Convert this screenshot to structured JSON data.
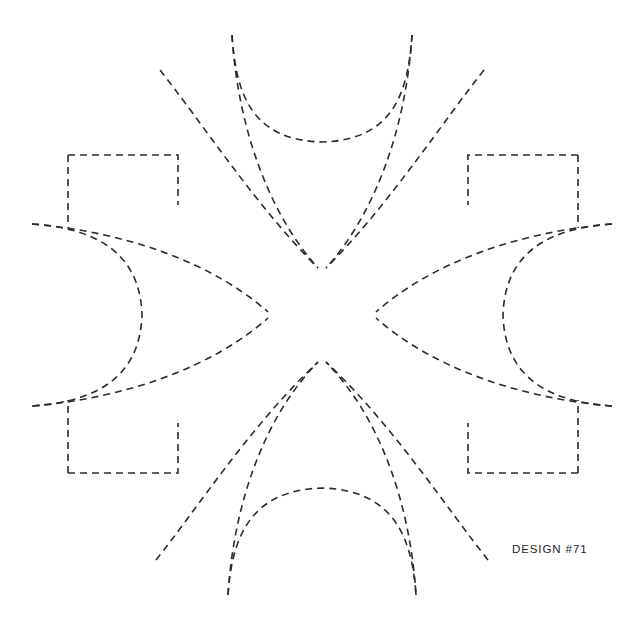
{
  "page": {
    "background_color": "#ffffff",
    "width": 635,
    "height": 629
  },
  "design": {
    "label": "DESIGN #71",
    "title": "DESIGN #71",
    "stroke_color": "#2b2b2b",
    "stroke_width": 1.6,
    "dash_pattern": "7 5",
    "center_x": 322,
    "center_y": 315,
    "symmetry": "8-fold radial (4 axial arms + 4 diagonal arms)",
    "motif": "dashed-outline eight-pointed floral star with corner bracket notches",
    "axial_tips": [
      {
        "name": "top-left-axial-tip",
        "x": 232,
        "y": 35
      },
      {
        "name": "top-right-axial-tip",
        "x": 412,
        "y": 35
      },
      {
        "name": "left-upper-axial-tip",
        "x": 32,
        "y": 224
      },
      {
        "name": "left-lower-axial-tip",
        "x": 32,
        "y": 406
      },
      {
        "name": "right-upper-axial-tip",
        "x": 612,
        "y": 224
      },
      {
        "name": "right-lower-axial-tip",
        "x": 612,
        "y": 406
      },
      {
        "name": "bottom-left-axial-tip",
        "x": 228,
        "y": 595
      },
      {
        "name": "bottom-right-axial-tip",
        "x": 416,
        "y": 595
      }
    ],
    "corner_notches": [
      {
        "name": "top-left-notch",
        "x": 68,
        "y": 155
      },
      {
        "name": "top-right-notch",
        "x": 578,
        "y": 155
      },
      {
        "name": "bottom-left-notch",
        "x": 68,
        "y": 473
      },
      {
        "name": "bottom-right-notch",
        "x": 578,
        "y": 473
      }
    ],
    "paths": {
      "top_arc": "M 232 35 C 236 95 252 140 322 142 C 392 140 408 95 412 35",
      "bottom_arc": "M 228 595 C 232 535 252 490 322 488 C 392 490 412 535 416 595",
      "left_arc": "M 32 224 C 92 228 140 250 142 315 C 140 380 92 402 32 406",
      "right_arc": "M 612 224 C 552 228 505 250 503 315 C 505 380 552 402 612 406",
      "petal_ul_outer": "M 232 35 C 238 130 270 215 318 268",
      "petal_ul_inner": "M 160 70 C 200 120 255 205 318 268",
      "petal_ur_outer": "M 412 35 C 406 130 374 215 326 268",
      "petal_ur_inner": "M 484 70 C 444 120 389 205 326 268",
      "petal_ll_outer": "M 228 595 C 234 500 266 415 318 362",
      "petal_ll_inner": "M 156 560 C 196 510 251 425 318 362",
      "petal_lr_outer": "M 416 595 C 410 500 378 415 326 362",
      "petal_lr_inner": "M 488 560 C 448 510 393 425 326 362",
      "petal_left_upper": "M 32 224 C 128 232 214 264 268 312",
      "petal_left_lower": "M 32 406 C 128 398 214 366 268 318",
      "petal_right_upper": "M 612 224 C 516 232 430 264 376 312",
      "petal_right_lower": "M 612 406 C 516 398 430 366 376 318",
      "notch_tl": "M 68 155 L 68 228 M 68 155 L 178 155 L 178 205",
      "notch_tr": "M 578 155 L 578 228 M 578 155 L 468 155 L 468 205",
      "notch_bl": "M 68 473 L 68 400 M 68 473 L 178 473 L 178 423",
      "notch_br": "M 578 473 L 578 400 M 578 473 L 468 473 L 468 423"
    }
  }
}
